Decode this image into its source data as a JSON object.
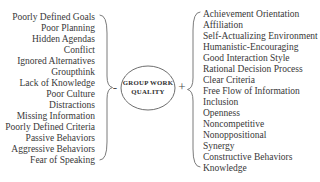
{
  "diagram": {
    "center_node": {
      "label_line1": "GROUP WORK",
      "label_line2": "QUALITY"
    },
    "negative": {
      "sign": "-",
      "factors": [
        "Poorly Defined Goals",
        "Poor Planning",
        "Hidden Agendas",
        "Conflict",
        "Ignored Alternatives",
        "Groupthink",
        "Lack of Knowledge",
        "Poor Culture",
        "Distractions",
        "Missing Information",
        "Poorly Defined Criteria",
        "Passive Behaviors",
        "Aggressive Behaviors",
        "Fear of Speaking"
      ]
    },
    "positive": {
      "sign": "+",
      "factors": [
        "Achievement Orientation",
        "Affiliation",
        "Self-Actualizing Environment",
        "Humanistic-Encouraging",
        "Good Interaction Style",
        "Rational Decision Process",
        "Clear Criteria",
        "Free Flow of Information",
        "Inclusion",
        "Openness",
        "Noncompetitive",
        "Nonoppositional",
        "Synergy",
        "Constructive Behaviors",
        "Knowledge"
      ]
    }
  },
  "colors": {
    "background": "#ffffff",
    "text": "#383838",
    "line": "#7b7b7b",
    "center_text": "#2e2e2e"
  }
}
